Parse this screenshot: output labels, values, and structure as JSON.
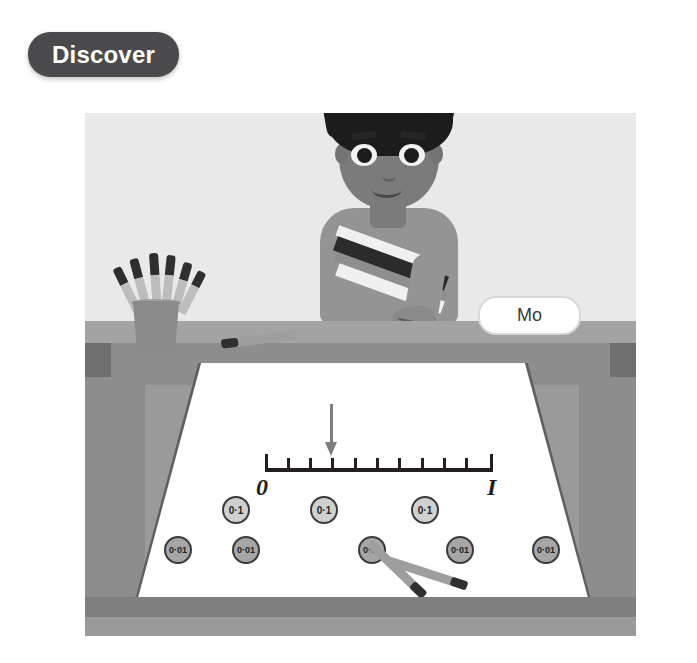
{
  "badge": {
    "label": "Discover"
  },
  "scene": {
    "character_name": "Mo",
    "colors": {
      "badge_bg": "#4a4a4c",
      "wall": "#e9e9e9",
      "desk": "#8d8d8d",
      "paper": "#ffffff",
      "counter_tenth": "#d0d0d0",
      "counter_hundredth": "#a6a6a6",
      "arrow": "#7d7d7d",
      "ink": "#231f20"
    }
  },
  "number_line": {
    "start_label": "0",
    "end_label": "I",
    "tick_count": 11,
    "intervals": 10,
    "arrow_points_to_tick": 3,
    "arrow_value": "0.3"
  },
  "counters": {
    "tenths": [
      {
        "label": "0·1",
        "x": 222,
        "y": 496
      },
      {
        "label": "0·1",
        "x": 310,
        "y": 496
      },
      {
        "label": "0·1",
        "x": 411,
        "y": 496
      }
    ],
    "hundredths": [
      {
        "label": "0·01",
        "x": 164,
        "y": 536
      },
      {
        "label": "0·01",
        "x": 232,
        "y": 536
      },
      {
        "label": "0·01",
        "x": 358,
        "y": 536
      },
      {
        "label": "0·01",
        "x": 446,
        "y": 536
      },
      {
        "label": "0·01",
        "x": 532,
        "y": 536
      }
    ]
  },
  "name_tag": {
    "text": "Mo"
  },
  "icons": {
    "arrow": "down-arrow-icon",
    "pen_pot": "pen-pot-icon",
    "pen": "pen-icon",
    "counter": "counter-token-icon",
    "boy": "student-avatar-icon"
  }
}
